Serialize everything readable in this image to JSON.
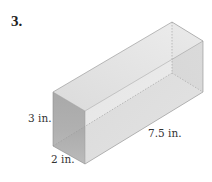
{
  "problem": {
    "number": "3.",
    "figure": "rectangular-prism",
    "dimensions": {
      "height": "3 in.",
      "width": "2 in.",
      "length": "7.5 in."
    }
  },
  "colors": {
    "front_face": "#a9a9a9",
    "top_face": "#e2e2e2",
    "side_face": "#d6d6d6",
    "back_face": "#bdbdbd",
    "bottom_face": "#d0d0d0",
    "edge": "#8a8a8a"
  }
}
